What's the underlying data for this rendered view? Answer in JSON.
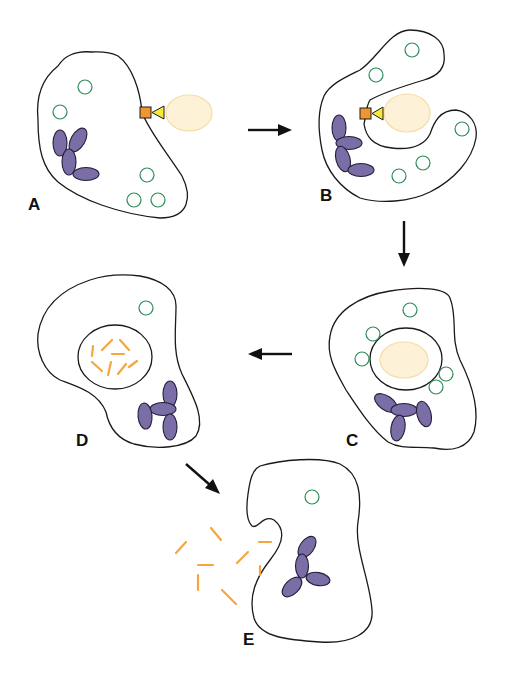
{
  "diagram": {
    "type": "process-flow",
    "colors": {
      "membrane": "#1a1a1a",
      "vesicle": "#2e8b57",
      "granule": "#7b6da5",
      "target_particle": "#fdf2d8",
      "receptor": "#f0962e",
      "ligand": "#f5e93a",
      "fragments": "#f4a640",
      "arrow": "#111111"
    },
    "panels": [
      {
        "id": "A",
        "label": "A",
        "description": "cell with surface receptor binding ligand on target particle"
      },
      {
        "id": "B",
        "label": "B",
        "description": "cell membrane engulfing the target particle"
      },
      {
        "id": "C",
        "label": "C",
        "description": "target particle enclosed in internal vacuole, vesicles surrounding"
      },
      {
        "id": "D",
        "label": "D",
        "description": "particle degraded into fragments inside vacuole"
      },
      {
        "id": "E",
        "label": "E",
        "description": "fragments expelled from the cell"
      }
    ],
    "arrows": [
      {
        "from": "A",
        "to": "B",
        "direction": "right"
      },
      {
        "from": "B",
        "to": "C",
        "direction": "down"
      },
      {
        "from": "C",
        "to": "D",
        "direction": "left"
      },
      {
        "from": "D",
        "to": "E",
        "direction": "down-right"
      }
    ]
  }
}
